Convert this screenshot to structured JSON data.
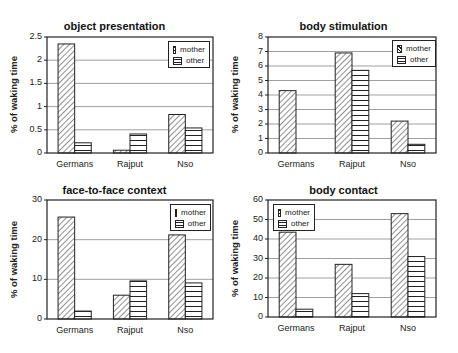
{
  "chart_data": [
    {
      "type": "bar",
      "title": "object presentation",
      "xlabel": "",
      "ylabel": "% of waking time",
      "categories": [
        "Germans",
        "Rajput",
        "Nso"
      ],
      "series": [
        {
          "name": "mother",
          "values": [
            2.35,
            0.06,
            0.83
          ]
        },
        {
          "name": "other",
          "values": [
            0.22,
            0.41,
            0.54
          ]
        }
      ],
      "ylim": [
        0,
        2.5
      ],
      "yticks": [
        "0",
        "0.5",
        "1",
        "1.5",
        "2",
        "2.5"
      ],
      "grid": true,
      "legend_position": "upper right"
    },
    {
      "type": "bar",
      "title": "body stimulation",
      "xlabel": "",
      "ylabel": "% of waking time",
      "categories": [
        "Germans",
        "Rajput",
        "Nso"
      ],
      "series": [
        {
          "name": "mother",
          "values": [
            4.3,
            6.9,
            2.2
          ]
        },
        {
          "name": "other",
          "values": [
            0,
            5.7,
            0.6
          ]
        }
      ],
      "ylim": [
        0,
        8
      ],
      "yticks": [
        "0",
        "1",
        "2",
        "3",
        "4",
        "5",
        "6",
        "7",
        "8"
      ],
      "grid": true,
      "legend_position": "upper right"
    },
    {
      "type": "bar",
      "title": "face-to-face context",
      "xlabel": "",
      "ylabel": "% of waking time",
      "categories": [
        "Germans",
        "Rajput",
        "Nso"
      ],
      "series": [
        {
          "name": "mother",
          "values": [
            25.7,
            6.0,
            21.2
          ]
        },
        {
          "name": "other",
          "values": [
            2.0,
            9.6,
            9.1
          ]
        }
      ],
      "ylim": [
        0,
        30
      ],
      "yticks": [
        "0",
        "10",
        "20",
        "30"
      ],
      "grid": true,
      "legend_position": "upper right"
    },
    {
      "type": "bar",
      "title": "body contact",
      "xlabel": "",
      "ylabel": "% of waking time",
      "categories": [
        "Germans",
        "Rajput",
        "Nso"
      ],
      "series": [
        {
          "name": "mother",
          "values": [
            43.5,
            27.0,
            53.0
          ]
        },
        {
          "name": "other",
          "values": [
            4.0,
            12.0,
            31.0
          ]
        }
      ],
      "ylim": [
        0,
        60
      ],
      "yticks": [
        "0",
        "10",
        "20",
        "30",
        "40",
        "50",
        "60"
      ],
      "grid": true,
      "legend_position": "upper left"
    }
  ],
  "layout": [
    {
      "left": 0,
      "top": 0,
      "plot": {
        "x": 47,
        "y": 37,
        "w": 166,
        "h": 116
      },
      "legend": {
        "x": 168,
        "y": 41,
        "w": 42,
        "h": 27
      },
      "title_y": 20
    },
    {
      "left": 229,
      "top": 0,
      "plot": {
        "x": 39,
        "y": 37,
        "w": 168,
        "h": 116
      },
      "legend": {
        "x": 163,
        "y": 40,
        "w": 44,
        "h": 27
      },
      "title_y": 20
    },
    {
      "left": 0,
      "top": 176,
      "plot": {
        "x": 47,
        "y": 24,
        "w": 166,
        "h": 119
      },
      "legend": {
        "x": 170,
        "y": 28,
        "w": 41,
        "h": 27
      },
      "title_y": 8
    },
    {
      "left": 229,
      "top": 176,
      "plot": {
        "x": 39,
        "y": 24,
        "w": 168,
        "h": 117
      },
      "legend": {
        "x": 44,
        "y": 28,
        "w": 42,
        "h": 27
      },
      "title_y": 8
    }
  ],
  "colors": {
    "axis": "#222222",
    "grid": "#888888",
    "bar_fill": "#ffffff",
    "bar_stroke": "#222222"
  }
}
